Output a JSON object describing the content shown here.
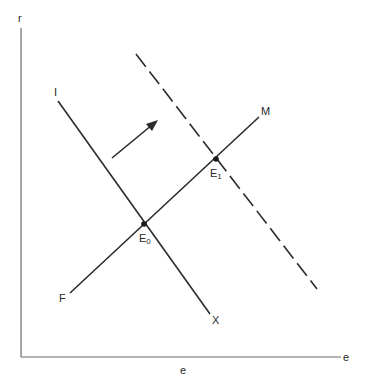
{
  "diagram": {
    "axes": {
      "y_label": "r",
      "x_label_end": "e",
      "x_label_below": "e",
      "color": "#6a6a6a"
    },
    "lines": {
      "IX": {
        "start_label": "I",
        "end_label": "X",
        "style": "solid"
      },
      "FM": {
        "start_label": "F",
        "end_label": "M",
        "style": "solid"
      },
      "shifted": {
        "style": "dashed"
      }
    },
    "points": {
      "E0": {
        "label": "E",
        "sub": "0"
      },
      "E1": {
        "label": "E",
        "sub": "1"
      }
    },
    "arrow": {
      "meaning": "shift-right"
    },
    "colors": {
      "line": "#2b2b2b",
      "background": "#ffffff"
    }
  }
}
